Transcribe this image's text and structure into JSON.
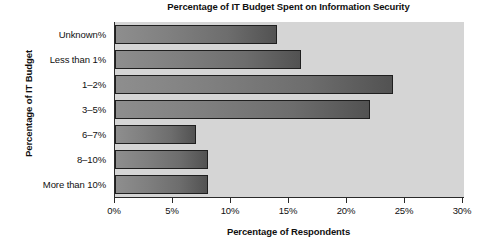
{
  "chart_data": {
    "type": "bar",
    "orientation": "horizontal",
    "title": "Percentage of IT Budget Spent on Information Security",
    "xlabel": "Percentage of Respondents",
    "ylabel": "Percentage of IT Budget",
    "categories": [
      "Unknown%",
      "Less than 1%",
      "1–2%",
      "3–5%",
      "6–7%",
      "8–10%",
      "More than 10%"
    ],
    "values": [
      14,
      16,
      24,
      22,
      7,
      8,
      8
    ],
    "xlim": [
      0,
      30
    ],
    "xticks": [
      0,
      5,
      10,
      15,
      20,
      25,
      30
    ],
    "xtick_labels": [
      "0%",
      "5%",
      "10%",
      "15%",
      "20%",
      "25%",
      "30%"
    ],
    "grid": false,
    "legend": false,
    "colors": {
      "plot_background": "#d5d5d5",
      "page_background": "#ffffff",
      "bar_gradient_start": "#8e8e8e",
      "bar_gradient_end": "#525252",
      "bar_border": "#1f1f1f",
      "axis": "#2a2a2a",
      "text": "#101010"
    }
  }
}
